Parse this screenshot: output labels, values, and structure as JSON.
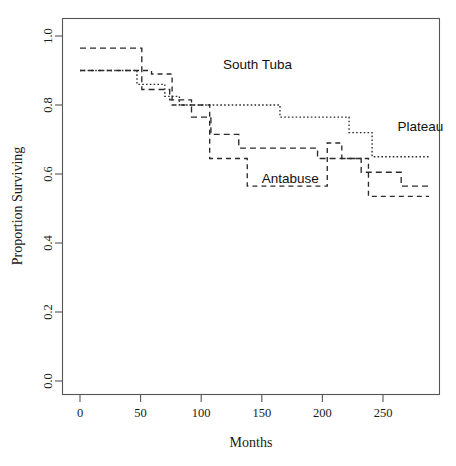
{
  "chart_data": {
    "type": "line",
    "title": "",
    "xlabel": "Months",
    "ylabel": "Proportion Surviving",
    "xlim": [
      -12,
      297
    ],
    "ylim": [
      0.0,
      1.0
    ],
    "xticks": [
      0,
      50,
      100,
      150,
      200,
      250
    ],
    "xtick_labels": [
      "0",
      "50",
      "100",
      "150",
      "200",
      "250"
    ],
    "yticks": [
      0.0,
      0.2,
      0.4,
      0.6,
      0.8,
      1.0
    ],
    "ytick_labels": [
      "0.0",
      "0.2",
      "0.4",
      "0.6",
      "0.8",
      "1.0"
    ],
    "grid": false,
    "legend_position": "inline-annotations",
    "step_style": "post",
    "series": [
      {
        "name": "South Tuba",
        "dash": "6 4",
        "label_x": 106,
        "label_y": 0.915,
        "x": [
          0,
          51,
          51,
          74,
          74,
          92,
          92,
          108,
          108,
          131,
          131,
          196,
          196,
          232,
          232,
          265,
          265,
          288
        ],
        "y": [
          0.965,
          0.965,
          0.845,
          0.845,
          0.815,
          0.815,
          0.765,
          0.765,
          0.715,
          0.715,
          0.675,
          0.675,
          0.645,
          0.645,
          0.605,
          0.605,
          0.565,
          0.565
        ]
      },
      {
        "name": "Plateau",
        "dash": "1.6 2.2",
        "label_x": 248,
        "label_y": 0.735,
        "x": [
          0,
          47,
          47,
          70,
          70,
          82,
          82,
          95,
          95,
          165,
          165,
          222,
          222,
          241,
          241,
          288
        ],
        "y": [
          0.9,
          0.9,
          0.86,
          0.86,
          0.825,
          0.825,
          0.8,
          0.8,
          0.8,
          0.8,
          0.765,
          0.765,
          0.72,
          0.72,
          0.65,
          0.65
        ]
      },
      {
        "name": "Antabuse",
        "dash": "5 4",
        "label_x": 152,
        "label_y": 0.595,
        "x": [
          0,
          59,
          59,
          76,
          76,
          107,
          107,
          138,
          138,
          204,
          204,
          216,
          216,
          238,
          238,
          288
        ],
        "y": [
          0.9,
          0.9,
          0.89,
          0.89,
          0.8,
          0.8,
          0.645,
          0.645,
          0.565,
          0.565,
          0.69,
          0.69,
          0.645,
          0.645,
          0.535,
          0.535
        ]
      }
    ],
    "annotations": [
      {
        "text": "South Tuba",
        "x": 118,
        "y": 0.918
      },
      {
        "text": "Plateau",
        "x": 262,
        "y": 0.738
      },
      {
        "text": "Antabuse",
        "x": 150,
        "y": 0.588
      }
    ]
  },
  "axes": {
    "x_title": "Months",
    "y_title": "Proportion Surviving"
  },
  "colors": {
    "line": "#2b2b2b",
    "axis": "#555555",
    "background": "#ffffff",
    "text": "#1a1a1a"
  }
}
